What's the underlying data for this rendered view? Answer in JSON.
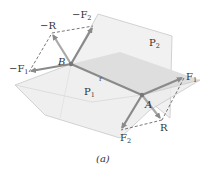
{
  "figure": {
    "caption": "(a)",
    "colors": {
      "background": "#ffffff",
      "plane_fill": "#eeeeee",
      "plane_shade": "#dcdcdc",
      "plane_edge": "#c8c8c8",
      "arrow": "#8a8a8a",
      "dashed": "#555555",
      "text": "#333333"
    },
    "planes": [
      {
        "id": "P2",
        "label": "P",
        "subscript": "2",
        "orientation": "vertical"
      },
      {
        "id": "P1",
        "label": "P",
        "subscript": "1",
        "orientation": "horizontal"
      }
    ],
    "points": [
      {
        "id": "B",
        "label": "B"
      },
      {
        "id": "A",
        "label": "A"
      }
    ],
    "position_vector": {
      "label": "r"
    },
    "vectors_at_A": [
      {
        "id": "F1",
        "label": "F",
        "subscript": "1",
        "prefix": ""
      },
      {
        "id": "F2",
        "label": "F",
        "subscript": "2",
        "prefix": ""
      },
      {
        "id": "R",
        "label": "R",
        "subscript": "",
        "prefix": ""
      }
    ],
    "vectors_at_B": [
      {
        "id": "negF1",
        "label": "F",
        "subscript": "1",
        "prefix": "−"
      },
      {
        "id": "negF2",
        "label": "F",
        "subscript": "2",
        "prefix": "−"
      },
      {
        "id": "negR",
        "label": "R",
        "subscript": "",
        "prefix": "−"
      }
    ]
  }
}
